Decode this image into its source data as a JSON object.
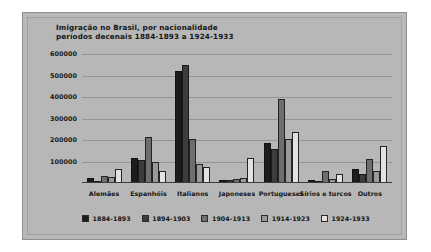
{
  "chart_data": {
    "type": "bar",
    "title": "Imigração no Brasil, por nacionalidade períodos decenais 1884-1893 a 1924-1933",
    "title_lines": [
      "Imigração no Brasil, por nacionalidade",
      "períodos decenais 1884-1893 a 1924-1933"
    ],
    "xlabel": "",
    "ylabel": "",
    "ylim": [
      0,
      600000
    ],
    "ytick_labels": [
      "600000",
      "500000",
      "400000",
      "300000",
      "200000",
      "100000"
    ],
    "ytick_values": [
      600000,
      500000,
      400000,
      300000,
      200000,
      100000
    ],
    "grid": true,
    "legend_position": "bottom",
    "categories": [
      "Alemães",
      "Espanhóis",
      "Italianos",
      "Japoneses",
      "Portugueses",
      "Sírios e turcos",
      "Outros"
    ],
    "series": [
      {
        "name": "1884-1893",
        "color": "#1c1c1c",
        "values": [
          22000,
          115000,
          520000,
          12000,
          185000,
          16000,
          66000
        ]
      },
      {
        "name": "1894-1903",
        "color": "#3c3c3c",
        "values": [
          6000,
          105000,
          550000,
          15000,
          160000,
          7000,
          42000
        ]
      },
      {
        "name": "1904-1913",
        "color": "#6e6e6e",
        "values": [
          34000,
          215000,
          205000,
          20000,
          390000,
          58000,
          110000
        ]
      },
      {
        "name": "1914-1923",
        "color": "#9a9a9a",
        "values": [
          28000,
          100000,
          90000,
          25000,
          205000,
          20000,
          55000
        ]
      },
      {
        "name": "1924-1933",
        "color": "#e2e2e2",
        "values": [
          65000,
          55000,
          75000,
          115000,
          235000,
          40000,
          170000
        ]
      }
    ]
  },
  "colors": {
    "figure_background": "#b7b7b7",
    "page_background": "#ffffff",
    "gridline": "#949494",
    "axis": "#3b3b3b",
    "text": "#151515"
  }
}
